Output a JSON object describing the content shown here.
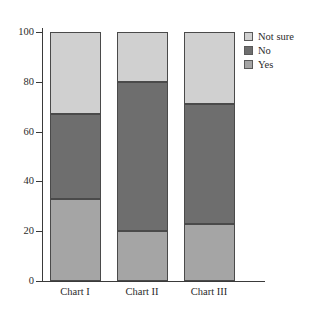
{
  "chart_data": {
    "type": "bar",
    "subtype": "stacked-bar-100-percent",
    "title": "",
    "xlabel": "",
    "ylabel": "",
    "categories": [
      "Chart I",
      "Chart II",
      "Chart III"
    ],
    "ylim": [
      0,
      100
    ],
    "yticks": [
      0,
      20,
      40,
      60,
      80,
      100
    ],
    "ytick_labels": [
      "0",
      "20",
      "40",
      "60",
      "80",
      "100"
    ],
    "grid": false,
    "legend_position": "right-top",
    "stack_order_bottom_to_top": [
      "Yes",
      "No",
      "Not sure"
    ],
    "series": [
      {
        "name": "Yes",
        "color": "#a5a5a5",
        "values": [
          33,
          20,
          23
        ]
      },
      {
        "name": "No",
        "color": "#6e6e6e",
        "values": [
          34,
          60,
          48
        ]
      },
      {
        "name": "Not sure",
        "color": "#d0d0d0",
        "values": [
          33,
          20,
          29
        ]
      }
    ],
    "cumulative_boundaries": {
      "Chart I": [
        33,
        67,
        100
      ],
      "Chart II": [
        20,
        80,
        100
      ],
      "Chart III": [
        23,
        71,
        100
      ]
    }
  },
  "legend": {
    "items": [
      {
        "label": "Not sure",
        "color": "#d0d0d0"
      },
      {
        "label": "No",
        "color": "#6e6e6e"
      },
      {
        "label": "Yes",
        "color": "#a5a5a5"
      }
    ]
  },
  "axis": {
    "y_ticks": [
      {
        "label": "100",
        "value": 100
      },
      {
        "label": "80",
        "value": 80
      },
      {
        "label": "60",
        "value": 60
      },
      {
        "label": "40",
        "value": 40
      },
      {
        "label": "20",
        "value": 20
      },
      {
        "label": "0",
        "value": 0
      }
    ],
    "x_labels": [
      "Chart I",
      "Chart II",
      "Chart III"
    ]
  }
}
